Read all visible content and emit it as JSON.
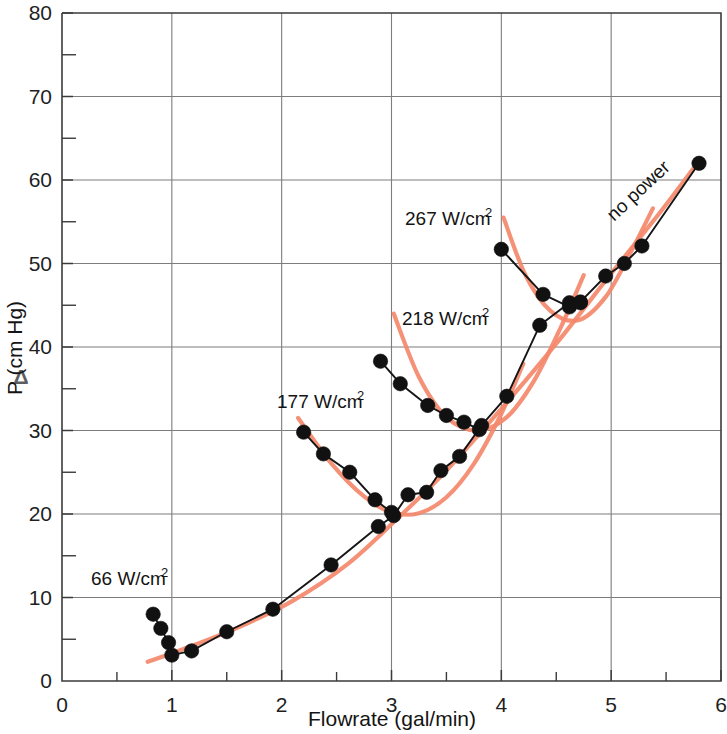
{
  "figure": {
    "name": "pressure-drop-vs-flowrate-chart",
    "background_color": "#ffffff",
    "ink_color": "#151515",
    "fit_curve_color": "#f4886b",
    "grid_color": "#7d7d7d"
  },
  "chart_data": {
    "type": "line",
    "title": "",
    "subtitle": "",
    "xlabel": "Flowrate (gal/min)",
    "ylabel": "ΔP (cm Hg)",
    "xlim": [
      0,
      6
    ],
    "ylim": [
      0,
      80
    ],
    "xticks": [
      0,
      1,
      2,
      3,
      4,
      5,
      6
    ],
    "xtick_labels": [
      "0",
      "1",
      "2",
      "3",
      "4",
      "5",
      "6"
    ],
    "xminor_ticks": [
      0.5,
      1.5,
      2.5,
      3.5,
      4.5,
      5.5
    ],
    "yticks": [
      0,
      10,
      20,
      30,
      40,
      50,
      60,
      70,
      80
    ],
    "ytick_labels": [
      "0",
      "10",
      "20",
      "30",
      "40",
      "50",
      "60",
      "70",
      "80"
    ],
    "yminor_ticks": [
      5,
      15,
      25,
      35,
      45,
      55,
      65,
      75
    ],
    "grid": true,
    "grid_axis": "both",
    "legend": "none",
    "marker": "filled-circle",
    "series": [
      {
        "name": "66 W/cm2 branch",
        "label": "66 W/cm²",
        "style": "black-line-with-markers",
        "x": [
          0.83,
          0.9,
          0.97,
          1.0,
          1.18,
          1.5,
          1.92,
          2.45,
          2.88,
          3.02,
          3.15,
          3.32,
          3.45,
          3.62,
          3.82,
          4.05,
          4.35,
          4.62,
          4.72,
          4.95,
          5.12,
          5.28,
          5.8
        ],
        "y": [
          8.0,
          6.3,
          4.6,
          3.1,
          3.6,
          5.9,
          8.6,
          13.9,
          18.5,
          19.8,
          22.3,
          22.6,
          25.2,
          26.9,
          30.6,
          34.1,
          42.6,
          45.3,
          45.4,
          48.5,
          50.0,
          52.1,
          62.0
        ]
      },
      {
        "name": "177 W/cm2 branch",
        "label": "177 W/cm²",
        "style": "black-line-with-markers",
        "x": [
          2.2,
          2.38,
          2.62,
          2.85,
          3.0
        ],
        "y": [
          29.8,
          27.2,
          25.0,
          21.7,
          20.2
        ]
      },
      {
        "name": "218 W/cm2 branch",
        "label": "218 W/cm²",
        "style": "black-line-with-markers",
        "x": [
          2.9,
          3.08,
          3.33,
          3.5,
          3.66,
          3.8
        ],
        "y": [
          38.3,
          35.6,
          33.0,
          31.8,
          31.0,
          30.1
        ]
      },
      {
        "name": "267 W/cm2 branch",
        "label": "267 W/cm²",
        "style": "black-line-with-markers",
        "x": [
          4.0,
          4.38,
          4.62,
          4.72
        ],
        "y": [
          51.7,
          46.3,
          44.8,
          45.3
        ]
      }
    ],
    "fitted_curves": [
      {
        "name": "no-power-fit",
        "label": "no power",
        "color": "#f4886b",
        "points_x": [
          0.78,
          1.1,
          1.6,
          2.1,
          2.6,
          3.05,
          3.5,
          4.0,
          4.5,
          5.0,
          5.45,
          5.75
        ],
        "points_y": [
          2.3,
          3.8,
          6.4,
          9.6,
          14.0,
          19.4,
          25.2,
          32.6,
          40.4,
          48.8,
          56.2,
          61.4
        ]
      },
      {
        "name": "177-fit",
        "color": "#f4886b",
        "points_x": [
          2.15,
          2.45,
          2.75,
          3.0,
          3.25,
          3.5,
          3.75,
          4.0,
          4.2
        ],
        "points_y": [
          31.5,
          26.1,
          22.1,
          20.2,
          20.1,
          22.0,
          26.0,
          32.0,
          38.0
        ]
      },
      {
        "name": "218-fit",
        "color": "#f4886b",
        "points_x": [
          3.02,
          3.25,
          3.5,
          3.78,
          4.05,
          4.3,
          4.55,
          4.75
        ],
        "points_y": [
          44.0,
          36.4,
          31.6,
          30.0,
          31.6,
          36.0,
          42.6,
          48.6
        ]
      },
      {
        "name": "267-fit",
        "color": "#f4886b",
        "points_x": [
          4.02,
          4.22,
          4.45,
          4.7,
          4.95,
          5.18,
          5.38
        ],
        "points_y": [
          55.5,
          48.6,
          44.3,
          43.2,
          46.0,
          51.4,
          56.6
        ]
      }
    ],
    "annotations": [
      {
        "name": "annotation-66",
        "text": "66 W/cm",
        "superscript": "2",
        "x_px": 91,
        "y_px": 585
      },
      {
        "name": "annotation-177",
        "text": "177 W/cm",
        "superscript": "2",
        "x_px": 277,
        "y_px": 408
      },
      {
        "name": "annotation-218",
        "text": "218 W/cm",
        "superscript": "2",
        "x_px": 402,
        "y_px": 325
      },
      {
        "name": "annotation-267",
        "text": "267 W/cm",
        "superscript": "2",
        "x_px": 405,
        "y_px": 225
      },
      {
        "name": "annotation-no-power",
        "text": "no power",
        "rotation": -43,
        "x_px": 614,
        "y_px": 222
      }
    ]
  }
}
